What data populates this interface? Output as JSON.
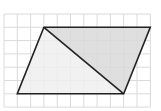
{
  "diagram": {
    "title": "",
    "grid": {
      "origin_px": [
        4,
        14
      ],
      "cell_px": 13.3,
      "cols": 11,
      "rows": 7,
      "line_color": "#dadada",
      "background": "#ffffff"
    },
    "shape": {
      "type": "parallelogram",
      "vertices_grid": {
        "top_left": [
          3,
          1
        ],
        "top_right": [
          11,
          1
        ],
        "bottom_right": [
          9,
          6
        ],
        "bottom_left": [
          1,
          6
        ]
      },
      "stroke_color": "#222222",
      "stroke_width": 1.6
    },
    "diagonal": {
      "from": "top_left",
      "to": "bottom_right"
    },
    "regions": [
      {
        "name": "upper-right-triangle",
        "vertices": [
          "top_left",
          "top_right",
          "bottom_right"
        ],
        "fill": "#d9d9d9"
      },
      {
        "name": "lower-left-triangle",
        "vertices": [
          "top_left",
          "bottom_right",
          "bottom_left"
        ],
        "fill": "#efefef"
      }
    ]
  }
}
